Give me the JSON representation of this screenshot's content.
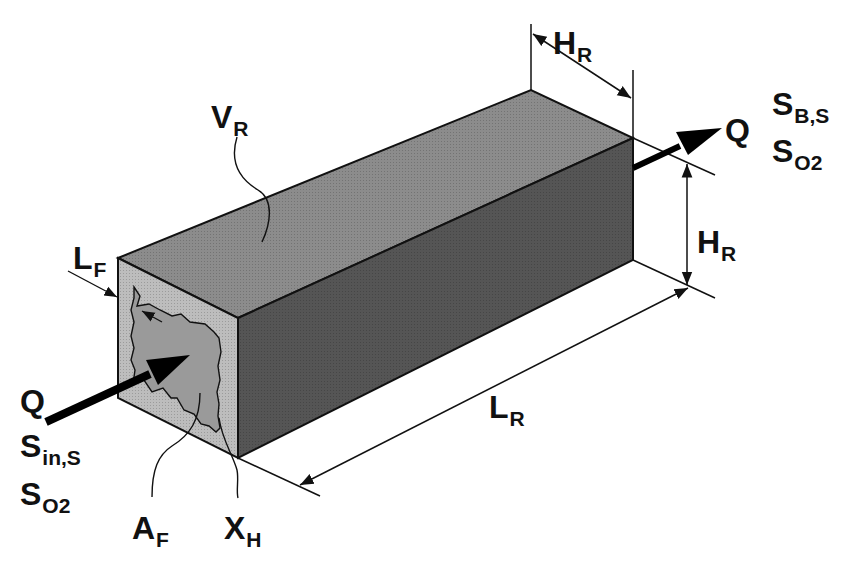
{
  "diagram": {
    "colors": {
      "top_face": "#8c8c8c",
      "side_face": "#5a5a5a",
      "front_face": "#b9b9b9",
      "biofilm_void": "#9a9a9a",
      "line": "#111111",
      "background": "#ffffff"
    },
    "labels": {
      "volume": {
        "main": "V",
        "sub": "R"
      },
      "height_top": {
        "main": "H",
        "sub": "R"
      },
      "height_side": {
        "main": "H",
        "sub": "R"
      },
      "length": {
        "main": "L",
        "sub": "R"
      },
      "film_thickness": {
        "main": "L",
        "sub": "F"
      },
      "area": {
        "main": "A",
        "sub": "F"
      },
      "biomass": {
        "main": "X",
        "sub": "H"
      },
      "inflow": {
        "flow": "Q",
        "substrate": {
          "main": "S",
          "sub": "in,S"
        },
        "oxygen": {
          "main": "S",
          "sub": "O2"
        }
      },
      "outflow": {
        "flow": "Q",
        "substrate": {
          "main": "S",
          "sub": "B,S"
        },
        "oxygen": {
          "main": "S",
          "sub": "O2"
        }
      }
    }
  }
}
